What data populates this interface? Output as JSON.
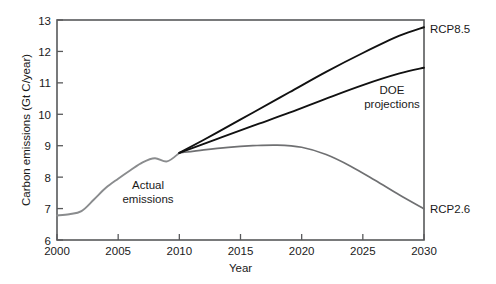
{
  "chart_data": {
    "type": "line",
    "title": "",
    "xlabel": "Year",
    "ylabel": "Carbon emissions (Gt C/year)",
    "xlim": [
      2000,
      2030
    ],
    "ylim": [
      6,
      13
    ],
    "xticks": [
      2000,
      2005,
      2010,
      2015,
      2020,
      2025,
      2030
    ],
    "yticks": [
      6,
      7,
      8,
      9,
      10,
      11,
      12,
      13
    ],
    "grid": false,
    "legend_position": "inline-annotations",
    "annotations": [
      {
        "text": "Actual emissions",
        "line1": "Actual",
        "line2": "emissions",
        "x": 2007.5,
        "y": 7.9
      },
      {
        "text": "DOE projections",
        "line1": "DOE",
        "line2": "projections",
        "x": 2026.5,
        "y": 10.6
      },
      {
        "text": "RCP8.5",
        "x": 2030.6,
        "y": 12.75
      },
      {
        "text": "RCP2.6",
        "x": 2030.6,
        "y": 6.95
      }
    ],
    "series": [
      {
        "name": "Actual emissions",
        "color": "#8a8c8e",
        "x": [
          2000,
          2001,
          2002,
          2003,
          2004,
          2005,
          2006,
          2007,
          2008,
          2009,
          2010
        ],
        "values": [
          6.78,
          6.82,
          6.92,
          7.28,
          7.66,
          7.95,
          8.22,
          8.47,
          8.6,
          8.5,
          8.77
        ]
      },
      {
        "name": "RCP8.5",
        "color": "#111111",
        "x": [
          2010,
          2013,
          2016,
          2019,
          2022,
          2025,
          2028,
          2030
        ],
        "values": [
          8.77,
          9.4,
          10.05,
          10.7,
          11.35,
          11.95,
          12.5,
          12.77
        ]
      },
      {
        "name": "DOE projections",
        "color": "#111111",
        "x": [
          2010,
          2013,
          2016,
          2019,
          2022,
          2025,
          2028,
          2030
        ],
        "values": [
          8.77,
          9.2,
          9.63,
          10.05,
          10.5,
          10.93,
          11.3,
          11.48
        ]
      },
      {
        "name": "RCP2.6",
        "color": "#6f7072",
        "x": [
          2010,
          2012,
          2014,
          2016,
          2018,
          2020,
          2022,
          2024,
          2026,
          2028,
          2030
        ],
        "values": [
          8.77,
          8.87,
          8.95,
          9.0,
          9.02,
          8.95,
          8.72,
          8.35,
          7.9,
          7.43,
          6.99
        ]
      }
    ]
  },
  "axis": {
    "y_title": "Carbon emissions (Gt C/year)",
    "x_title": "Year",
    "y_tick_labels": [
      "13",
      "12",
      "11",
      "10",
      "9",
      "8",
      "7",
      "6"
    ],
    "x_tick_labels": [
      "2000",
      "2005",
      "2010",
      "2015",
      "2020",
      "2025",
      "2030"
    ]
  },
  "labels": {
    "rcp85": "RCP8.5",
    "rcp26": "RCP2.6",
    "doe_line1": "DOE",
    "doe_line2": "projections",
    "actual_line1": "Actual",
    "actual_line2": "emissions"
  },
  "colors": {
    "actual": "#8a8c8e",
    "projection": "#111111",
    "rcp26": "#6f7072",
    "frame": "#58595b",
    "background": "#ffffff"
  }
}
